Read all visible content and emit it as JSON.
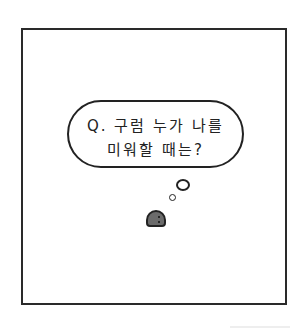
{
  "comic": {
    "speech_bubble": {
      "line1": "Q. 구럼 누가 나를",
      "line2": "미워할 때는?"
    },
    "character": "gray-round-blob",
    "colors": {
      "ink": "#222222",
      "character": "#6b6b6b",
      "background": "#ffffff"
    }
  }
}
